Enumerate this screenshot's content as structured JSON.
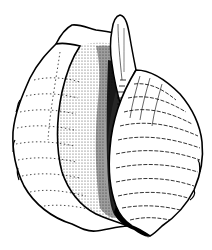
{
  "image": {
    "subject": "seashell line drawing",
    "width": 212,
    "height": 250,
    "background_color": "#ffffff",
    "ink_color": "#000000",
    "shading_color": "#333333"
  }
}
